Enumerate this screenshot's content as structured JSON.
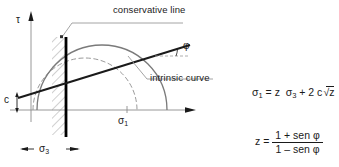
{
  "diagram": {
    "axes": {
      "y_label": "τ",
      "x_label": "σ",
      "x_label_sub": "1"
    },
    "annotations": {
      "conservative_line": "conservative line",
      "intrinsic_curve": "intrinsic curve",
      "friction_angle": "φ",
      "cohesion": "c",
      "confining_stress": "σ",
      "confining_stress_sub": "3"
    },
    "colors": {
      "envelope_line": "#1a1a1a",
      "conservative_bar": "#000000",
      "mohr_circle_solid": "#7a7a7a",
      "mohr_circle_dashed": "#9a9a9a",
      "axis": "#8c8c8c",
      "hatching": "#8c8c8c",
      "leader": "#9a9a9a",
      "text": "#1a1a1a",
      "background": "#ffffff"
    }
  },
  "equations": {
    "eq1": {
      "lhs": "σ",
      "lhs_sub": "1",
      "eq": "=",
      "z1": "z",
      "sigma3": "σ",
      "sigma3_sub": "3",
      "plus": "+ 2 c",
      "radicand": "z",
      "full_text": "σ1 = z σ3 + 2c√z"
    },
    "eq2": {
      "lhs": "z",
      "eq": "=",
      "numerator": "1 + sen φ",
      "denominator": "1 – sen φ",
      "full_text": "z = (1 + sen φ) / (1 – sen φ)"
    }
  }
}
